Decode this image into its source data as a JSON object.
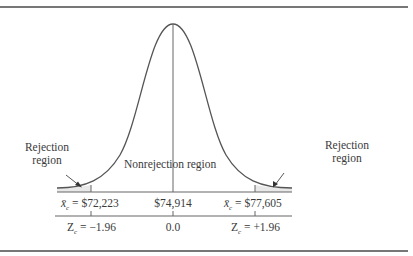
{
  "diagram": {
    "type": "normal-distribution-two-tailed-test",
    "left_rejection_label": [
      "Rejection",
      "region"
    ],
    "right_rejection_label": [
      "Rejection",
      "region"
    ],
    "nonrejection_label": "Nonrejection region",
    "x_scale": {
      "left_critical": {
        "symbol": "x̄",
        "sub": "c",
        "value": "= $72,223"
      },
      "mean": "$74,914",
      "right_critical": {
        "symbol": "x̄",
        "sub": "c",
        "value": "= $77,605"
      }
    },
    "z_scale": {
      "left_critical": {
        "symbol": "Z",
        "sub": "c",
        "value": "= −1.96"
      },
      "mean": "0.0",
      "right_critical": {
        "symbol": "Z",
        "sub": "c",
        "value": "= +1.96"
      }
    },
    "colors": {
      "curve": "#555555",
      "shade": "#e6e6e6",
      "rule": "#777777"
    }
  }
}
